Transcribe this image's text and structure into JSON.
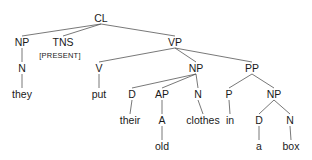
{
  "diagram": {
    "type": "syntax-tree",
    "nodes": [
      {
        "id": "cl",
        "label": "CL",
        "x": 101,
        "y": 18
      },
      {
        "id": "np1",
        "label": "NP",
        "x": 22,
        "y": 42
      },
      {
        "id": "tns",
        "label": "TNS",
        "x": 63,
        "y": 42
      },
      {
        "id": "present",
        "label": "[PRESENT]",
        "x": 60,
        "y": 56,
        "small": true
      },
      {
        "id": "vp",
        "label": "VP",
        "x": 175,
        "y": 42
      },
      {
        "id": "n1",
        "label": "N",
        "x": 22,
        "y": 68
      },
      {
        "id": "v",
        "label": "V",
        "x": 99,
        "y": 68
      },
      {
        "id": "np2",
        "label": "NP",
        "x": 196,
        "y": 68
      },
      {
        "id": "pp",
        "label": "PP",
        "x": 252,
        "y": 68
      },
      {
        "id": "they",
        "label": "they",
        "x": 22,
        "y": 94
      },
      {
        "id": "put",
        "label": "put",
        "x": 99,
        "y": 94
      },
      {
        "id": "d1",
        "label": "D",
        "x": 132,
        "y": 94
      },
      {
        "id": "ap",
        "label": "AP",
        "x": 162,
        "y": 94
      },
      {
        "id": "n2",
        "label": "N",
        "x": 198,
        "y": 94
      },
      {
        "id": "p",
        "label": "P",
        "x": 229,
        "y": 94
      },
      {
        "id": "np3",
        "label": "NP",
        "x": 274,
        "y": 94
      },
      {
        "id": "their",
        "label": "their",
        "x": 130,
        "y": 120
      },
      {
        "id": "a_adj",
        "label": "A",
        "x": 162,
        "y": 120
      },
      {
        "id": "clothes",
        "label": "clothes",
        "x": 203,
        "y": 120
      },
      {
        "id": "in",
        "label": "in",
        "x": 230,
        "y": 120
      },
      {
        "id": "d2",
        "label": "D",
        "x": 259,
        "y": 120
      },
      {
        "id": "n3",
        "label": "N",
        "x": 290,
        "y": 120
      },
      {
        "id": "old",
        "label": "old",
        "x": 162,
        "y": 146
      },
      {
        "id": "a_det",
        "label": "a",
        "x": 259,
        "y": 146
      },
      {
        "id": "box",
        "label": "box",
        "x": 291,
        "y": 146
      }
    ],
    "edges": [
      [
        "cl",
        "np1"
      ],
      [
        "cl",
        "tns"
      ],
      [
        "cl",
        "vp"
      ],
      [
        "np1",
        "n1"
      ],
      [
        "n1",
        "they"
      ],
      [
        "vp",
        "v"
      ],
      [
        "vp",
        "np2"
      ],
      [
        "vp",
        "pp"
      ],
      [
        "v",
        "put"
      ],
      [
        "np2",
        "d1"
      ],
      [
        "np2",
        "ap"
      ],
      [
        "np2",
        "n2"
      ],
      [
        "d1",
        "their"
      ],
      [
        "ap",
        "a_adj"
      ],
      [
        "a_adj",
        "old"
      ],
      [
        "n2",
        "clothes"
      ],
      [
        "pp",
        "p"
      ],
      [
        "pp",
        "np3"
      ],
      [
        "p",
        "in"
      ],
      [
        "np3",
        "d2"
      ],
      [
        "np3",
        "n3"
      ],
      [
        "d2",
        "a_det"
      ],
      [
        "n3",
        "box"
      ]
    ]
  }
}
